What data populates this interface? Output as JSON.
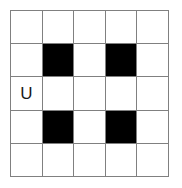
{
  "figure": {
    "name": "grid-pattern-puzzle",
    "grid": {
      "rows": 5,
      "columns": 5,
      "line_color": "#808080",
      "fill_color": "#000000",
      "empty_color": "#ffffff"
    },
    "cells": [
      [
        {
          "state": "empty",
          "label": ""
        },
        {
          "state": "empty",
          "label": ""
        },
        {
          "state": "empty",
          "label": ""
        },
        {
          "state": "empty",
          "label": ""
        },
        {
          "state": "empty",
          "label": ""
        }
      ],
      [
        {
          "state": "empty",
          "label": ""
        },
        {
          "state": "filled",
          "label": ""
        },
        {
          "state": "empty",
          "label": ""
        },
        {
          "state": "filled",
          "label": ""
        },
        {
          "state": "empty",
          "label": ""
        }
      ],
      [
        {
          "state": "empty",
          "label": "U"
        },
        {
          "state": "empty",
          "label": ""
        },
        {
          "state": "empty",
          "label": ""
        },
        {
          "state": "empty",
          "label": ""
        },
        {
          "state": "empty",
          "label": ""
        }
      ],
      [
        {
          "state": "empty",
          "label": ""
        },
        {
          "state": "filled",
          "label": ""
        },
        {
          "state": "empty",
          "label": ""
        },
        {
          "state": "filled",
          "label": ""
        },
        {
          "state": "empty",
          "label": ""
        }
      ],
      [
        {
          "state": "empty",
          "label": ""
        },
        {
          "state": "empty",
          "label": ""
        },
        {
          "state": "empty",
          "label": ""
        },
        {
          "state": "empty",
          "label": ""
        },
        {
          "state": "empty",
          "label": ""
        }
      ]
    ]
  }
}
